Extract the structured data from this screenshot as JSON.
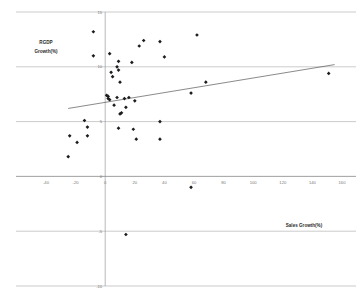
{
  "chart_data": {
    "type": "scatter",
    "title": "",
    "xlabel": "Sales Growth(%)",
    "ylabel": "RGDP Growth(%)",
    "xlim": [
      -40,
      160
    ],
    "ylim": [
      -10,
      15
    ],
    "xticks": [
      -40,
      -20,
      0,
      20,
      40,
      60,
      80,
      100,
      120,
      140,
      160
    ],
    "xtick_labels": [
      "-40",
      "-20",
      "0",
      "20",
      "40",
      "60",
      "80",
      "100",
      "120",
      "140",
      "160"
    ],
    "yticks": [
      -10,
      -5,
      0,
      5,
      10,
      15
    ],
    "ytick_labels": [
      "-10",
      "-5",
      "0",
      "5",
      "10",
      "15"
    ],
    "grid": "horizontal",
    "legend": "none",
    "marker": "diamond",
    "marker_color": "#1c1c1c",
    "points": [
      {
        "x": -8,
        "y": 13.2
      },
      {
        "x": -8,
        "y": 11.0
      },
      {
        "x": 3,
        "y": 11.2
      },
      {
        "x": 9,
        "y": 10.5
      },
      {
        "x": 18,
        "y": 10.4
      },
      {
        "x": 23,
        "y": 11.9
      },
      {
        "x": 26,
        "y": 12.4
      },
      {
        "x": 37,
        "y": 12.3
      },
      {
        "x": 40,
        "y": 10.9
      },
      {
        "x": 62,
        "y": 12.9
      },
      {
        "x": 4,
        "y": 9.5
      },
      {
        "x": 8,
        "y": 10.0
      },
      {
        "x": 9,
        "y": 9.7
      },
      {
        "x": 5,
        "y": 9.1
      },
      {
        "x": 10,
        "y": 8.6
      },
      {
        "x": 151,
        "y": 9.4
      },
      {
        "x": 68,
        "y": 8.6
      },
      {
        "x": 58,
        "y": 7.6
      },
      {
        "x": 1,
        "y": 7.4
      },
      {
        "x": 2,
        "y": 7.3
      },
      {
        "x": 2,
        "y": 7.1
      },
      {
        "x": 3,
        "y": 7.0
      },
      {
        "x": 8,
        "y": 7.2
      },
      {
        "x": 13,
        "y": 7.1
      },
      {
        "x": 16,
        "y": 7.2
      },
      {
        "x": 20,
        "y": 6.9
      },
      {
        "x": 6,
        "y": 6.5
      },
      {
        "x": 11,
        "y": 5.8
      },
      {
        "x": 14,
        "y": 6.3
      },
      {
        "x": 10,
        "y": 5.7
      },
      {
        "x": -14,
        "y": 5.1
      },
      {
        "x": 37,
        "y": 5.0
      },
      {
        "x": -12,
        "y": 4.5
      },
      {
        "x": 9,
        "y": 4.4
      },
      {
        "x": 19,
        "y": 4.3
      },
      {
        "x": -12,
        "y": 3.7
      },
      {
        "x": -24,
        "y": 3.7
      },
      {
        "x": 21,
        "y": 3.4
      },
      {
        "x": 37,
        "y": 3.4
      },
      {
        "x": -19,
        "y": 3.1
      },
      {
        "x": -25,
        "y": 1.8
      },
      {
        "x": 58,
        "y": -1.0
      },
      {
        "x": 14,
        "y": -5.3
      }
    ],
    "trendline": {
      "x_start": -25,
      "y_start": 6.2,
      "x_end": 155,
      "y_end": 10.2
    }
  }
}
